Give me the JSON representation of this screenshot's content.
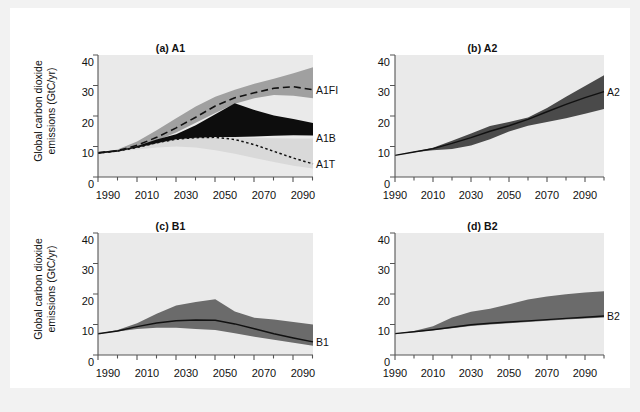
{
  "figure": {
    "background": "#ffffff",
    "outer_background": "#f2f2f2",
    "plot_background": "#eaeaea"
  },
  "axis": {
    "ylabel_line1": "Global carbon dioxide",
    "ylabel_line2": "emissions (GtC/yr)",
    "yticks": [
      "0",
      "10",
      "20",
      "30",
      "40"
    ],
    "ytick_values": [
      0,
      10,
      20,
      30,
      40
    ],
    "xticks": [
      "1990",
      "2010",
      "2030",
      "2050",
      "2070",
      "2090"
    ],
    "xtick_values": [
      1990,
      2010,
      2030,
      2050,
      2070,
      2090
    ],
    "xlim": [
      1990,
      2100
    ],
    "ylim": [
      0,
      40
    ],
    "minor_tick_step": 10
  },
  "panels": [
    {
      "id": "a",
      "title": "(a) A1"
    },
    {
      "id": "b",
      "title": "(b) A2"
    },
    {
      "id": "c",
      "title": "(c) B1"
    },
    {
      "id": "d",
      "title": "(d) B2"
    }
  ],
  "series_labels": {
    "a1fi": "A1FI",
    "a1b": "A1B",
    "a1t": "A1T",
    "a2": "A2",
    "b1": "B1",
    "b2": "B2"
  },
  "colors": {
    "range_light_grey": "#d9d9d9",
    "range_mid_grey": "#a0a0a0",
    "range_dark_grey": "#6b6b6b",
    "range_black": "#0d0d0d",
    "line_black": "#111111",
    "plot_bg": "#eaeaea",
    "axis": "#555555",
    "text": "#111111"
  },
  "chart_data": {
    "type": "area",
    "xlabel": "",
    "ylabel": "Global carbon dioxide emissions (GtC/yr)",
    "xlim": [
      1990,
      2100
    ],
    "ylim": [
      0,
      40
    ],
    "grid": false,
    "legend_position": "right-of-axes (inline series labels)",
    "x": [
      1990,
      2000,
      2010,
      2020,
      2030,
      2040,
      2050,
      2060,
      2070,
      2080,
      2090,
      2100
    ],
    "panels": [
      {
        "id": "a",
        "title": "(a) A1",
        "series": [
          {
            "name": "A1FI",
            "kind": "line-dashed",
            "values": [
              7.9,
              8.6,
              10.4,
              13.0,
              16.1,
              19.6,
              23.3,
              26.0,
              27.6,
              29.1,
              29.6,
              28.6
            ],
            "band": {
              "name": "A1FI range",
              "color": "#a0a0a0",
              "upper": [
                7.9,
                9.0,
                11.6,
                15.3,
                19.3,
                23.1,
                26.3,
                28.6,
                30.6,
                32.2,
                34.0,
                36.0
              ],
              "lower": [
                7.9,
                8.3,
                9.8,
                11.9,
                14.6,
                17.8,
                21.0,
                24.0,
                25.8,
                26.9,
                26.6,
                25.8
              ]
            }
          },
          {
            "name": "A1B",
            "kind": "band-black",
            "band": {
              "name": "A1B range",
              "color": "#0d0d0d",
              "upper": [
                7.9,
                8.6,
                10.2,
                12.3,
                14.0,
                17.0,
                20.6,
                24.2,
                22.0,
                20.2,
                19.0,
                17.7
              ],
              "lower": [
                7.9,
                8.4,
                9.6,
                11.1,
                12.4,
                12.9,
                13.1,
                13.1,
                13.3,
                13.5,
                13.7,
                13.6
              ]
            }
          },
          {
            "name": "A1T",
            "kind": "line-dotted",
            "values": [
              7.9,
              8.5,
              9.7,
              11.2,
              12.4,
              12.9,
              13.0,
              12.3,
              10.6,
              8.4,
              6.2,
              4.3
            ],
            "band": {
              "name": "A1T range",
              "color": "#d9d9d9",
              "upper": [
                7.9,
                8.6,
                9.9,
                11.4,
                12.6,
                13.1,
                13.2,
                13.0,
                12.8,
                12.7,
                12.6,
                12.6
              ],
              "lower": [
                7.9,
                8.3,
                9.0,
                9.7,
                10.0,
                9.7,
                8.8,
                7.6,
                6.2,
                4.9,
                3.7,
                2.8
              ]
            }
          }
        ]
      },
      {
        "id": "b",
        "title": "(b) A2",
        "series": [
          {
            "name": "A2",
            "kind": "line-solid",
            "values": [
              7.1,
              8.2,
              9.3,
              11.0,
              12.9,
              15.0,
              16.8,
              18.9,
              21.4,
              23.8,
              26.0,
              28.0
            ],
            "band": {
              "name": "A2 range",
              "color": "#4a4a4a",
              "upper": [
                7.1,
                8.3,
                9.6,
                11.9,
                14.3,
                16.7,
                18.0,
                19.5,
                22.6,
                26.3,
                29.8,
                33.4
              ],
              "lower": [
                7.1,
                8.1,
                8.8,
                9.2,
                10.3,
                12.4,
                14.9,
                16.8,
                18.0,
                19.3,
                20.7,
                22.3
              ]
            }
          }
        ]
      },
      {
        "id": "c",
        "title": "(c) B1",
        "series": [
          {
            "name": "B1",
            "kind": "line-solid",
            "values": [
              7.0,
              7.9,
              9.3,
              10.5,
              11.2,
              11.5,
              11.4,
              10.2,
              8.6,
              7.0,
              5.6,
              4.3
            ],
            "band": {
              "name": "B1 range",
              "color": "#6b6b6b",
              "upper": [
                7.0,
                8.2,
                10.4,
                13.5,
                16.2,
                17.4,
                18.3,
                14.3,
                12.2,
                11.6,
                10.8,
                10.0
              ],
              "lower": [
                7.0,
                7.7,
                8.5,
                8.9,
                8.9,
                8.5,
                8.2,
                7.1,
                6.0,
                5.0,
                4.0,
                3.0
              ]
            }
          }
        ]
      },
      {
        "id": "d",
        "title": "(d) B2",
        "series": [
          {
            "name": "B2",
            "kind": "line-solid",
            "values": [
              7.0,
              7.6,
              8.3,
              9.1,
              9.9,
              10.4,
              10.8,
              11.2,
              11.6,
              12.0,
              12.4,
              12.8
            ],
            "band": {
              "name": "B2 range",
              "color": "#6b6b6b",
              "upper": [
                7.0,
                7.9,
                9.4,
                12.3,
                14.2,
                15.2,
                16.6,
                18.2,
                19.2,
                19.9,
                20.5,
                20.9
              ],
              "lower": [
                7.0,
                7.5,
                8.1,
                8.8,
                9.5,
                10.0,
                10.4,
                10.8,
                11.2,
                11.6,
                12.0,
                12.3
              ]
            }
          }
        ]
      }
    ]
  }
}
